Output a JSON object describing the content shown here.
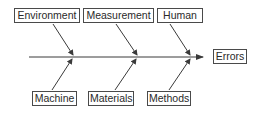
{
  "diagram": {
    "type": "fishbone",
    "effect": "Errors",
    "causes_top": [
      "Environment",
      "Measurement",
      "Human"
    ],
    "causes_bottom": [
      "Machine",
      "Materials",
      "Methods"
    ],
    "colors": {
      "line": "#3a3a3a",
      "box_border": "#4a4a4a",
      "text": "#2a2a2a",
      "background": "#ffffff"
    }
  }
}
